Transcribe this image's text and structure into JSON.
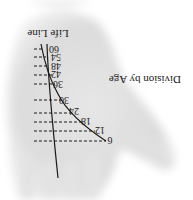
{
  "figure": {
    "title": "Life Line",
    "subtitle": "Division by Age",
    "orientation": "rotated 180°",
    "age_marks": [
      {
        "age": "6",
        "x": 110,
        "y": 141
      },
      {
        "age": "12",
        "x": 100,
        "y": 131
      },
      {
        "age": "18",
        "x": 86,
        "y": 122
      },
      {
        "age": "24",
        "x": 74,
        "y": 112
      },
      {
        "age": "30",
        "x": 64,
        "y": 101
      },
      {
        "age": "36",
        "x": 58,
        "y": 85
      },
      {
        "age": "42",
        "x": 56,
        "y": 75
      },
      {
        "age": "48",
        "x": 56,
        "y": 67
      },
      {
        "age": "54",
        "x": 56,
        "y": 58
      },
      {
        "age": "60",
        "x": 54,
        "y": 50
      }
    ],
    "colors": {
      "ink": "#1a1a1a",
      "palm_shade": "#d9d9d9",
      "background": "#ffffff"
    }
  }
}
